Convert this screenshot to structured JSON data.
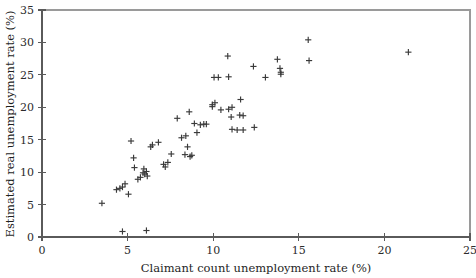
{
  "chart_data": {
    "type": "scatter",
    "title": "",
    "xlabel": "Claimant count unemployment rate (%)",
    "ylabel": "Estimated real unemployment rate (%)",
    "xlim": [
      0,
      25
    ],
    "ylim": [
      0,
      35
    ],
    "xticks": [
      0,
      5,
      10,
      15,
      20,
      25
    ],
    "yticks": [
      0,
      5,
      10,
      15,
      20,
      25,
      30,
      35
    ],
    "xtick_labels": [
      "0",
      "5",
      "10",
      "15",
      "20",
      "25"
    ],
    "ytick_labels": [
      "0",
      "5",
      "10",
      "15",
      "20",
      "25",
      "30",
      "35"
    ],
    "grid": false,
    "legend": null,
    "marker": "plus",
    "marker_color": "#3a3a3a",
    "series": [
      {
        "name": "regions",
        "points": [
          [
            3.5,
            5.2
          ],
          [
            4.35,
            7.3
          ],
          [
            4.55,
            7.5
          ],
          [
            4.7,
            7.7
          ],
          [
            4.85,
            8.2
          ],
          [
            4.7,
            0.85
          ],
          [
            5.05,
            6.6
          ],
          [
            5.2,
            14.8
          ],
          [
            5.35,
            12.2
          ],
          [
            5.4,
            10.7
          ],
          [
            5.6,
            8.9
          ],
          [
            5.75,
            9.2
          ],
          [
            5.9,
            9.9
          ],
          [
            5.95,
            10.5
          ],
          [
            6.0,
            9.7
          ],
          [
            6.1,
            10.1
          ],
          [
            6.15,
            9.4
          ],
          [
            6.1,
            1.0
          ],
          [
            6.35,
            13.9
          ],
          [
            6.45,
            14.2
          ],
          [
            6.8,
            14.6
          ],
          [
            7.1,
            11.2
          ],
          [
            7.2,
            10.8
          ],
          [
            7.35,
            11.5
          ],
          [
            7.55,
            12.8
          ],
          [
            7.9,
            18.3
          ],
          [
            8.15,
            15.3
          ],
          [
            8.35,
            12.7
          ],
          [
            8.4,
            15.6
          ],
          [
            8.5,
            13.9
          ],
          [
            8.6,
            19.3
          ],
          [
            8.65,
            12.4
          ],
          [
            8.75,
            12.6
          ],
          [
            8.9,
            17.5
          ],
          [
            9.05,
            16.1
          ],
          [
            9.25,
            17.3
          ],
          [
            9.45,
            17.4
          ],
          [
            9.6,
            17.4
          ],
          [
            9.95,
            20.4
          ],
          [
            9.95,
            20.1
          ],
          [
            10.05,
            24.6
          ],
          [
            10.3,
            24.6
          ],
          [
            10.1,
            20.7
          ],
          [
            10.45,
            19.6
          ],
          [
            10.85,
            27.9
          ],
          [
            10.9,
            24.7
          ],
          [
            10.9,
            19.7
          ],
          [
            11.05,
            18.5
          ],
          [
            11.1,
            20.0
          ],
          [
            11.1,
            16.6
          ],
          [
            11.4,
            16.5
          ],
          [
            11.55,
            18.8
          ],
          [
            11.6,
            21.2
          ],
          [
            11.75,
            18.7
          ],
          [
            11.75,
            16.5
          ],
          [
            12.35,
            26.3
          ],
          [
            12.4,
            16.9
          ],
          [
            13.05,
            24.6
          ],
          [
            13.75,
            27.4
          ],
          [
            13.9,
            26.0
          ],
          [
            13.95,
            25.4
          ],
          [
            13.95,
            25.1
          ],
          [
            15.55,
            30.4
          ],
          [
            15.6,
            27.2
          ],
          [
            21.4,
            28.5
          ]
        ]
      }
    ]
  },
  "layout": {
    "plot_left_px": 42,
    "plot_right_px": 470,
    "plot_top_px": 10,
    "plot_bottom_px": 237
  }
}
